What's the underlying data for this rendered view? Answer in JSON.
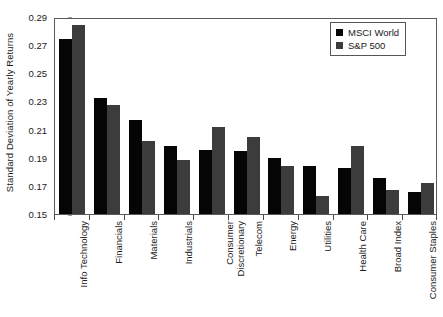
{
  "chart_data": {
    "type": "bar",
    "title": "",
    "xlabel": "",
    "ylabel": "Standard Deviation of Yearly Returns",
    "ylim": [
      0.15,
      0.29
    ],
    "yticks": [
      0.15,
      0.17,
      0.19,
      0.21,
      0.23,
      0.25,
      0.27,
      0.29
    ],
    "ytick_labels": [
      "0.15",
      "0.17",
      "0.19",
      "0.21",
      "0.23",
      "0.25",
      "0.27",
      "0.29"
    ],
    "grid": false,
    "legend_position": "top-right",
    "categories": [
      "Info Technology",
      "Financials",
      "Materials",
      "Industrials",
      "Consumer Discretionary",
      "Telecom",
      "Energy",
      "Utilities",
      "Health Care",
      "Broad Index",
      "Consumer Staples"
    ],
    "category_lines": [
      [
        "Info Technology"
      ],
      [
        "Financials"
      ],
      [
        "Materials"
      ],
      [
        "Industrials"
      ],
      [
        "Consumer",
        "Discretionary"
      ],
      [
        "Telecom"
      ],
      [
        "Energy"
      ],
      [
        "Utilities"
      ],
      [
        "Health Care"
      ],
      [
        "Broad Index"
      ],
      [
        "Consumer Staples"
      ]
    ],
    "series": [
      {
        "name": "MSCI World",
        "color": "#050505",
        "values": [
          0.2745,
          0.2325,
          0.2165,
          0.198,
          0.1955,
          0.195,
          0.19,
          0.184,
          0.183,
          0.1755,
          0.166
        ]
      },
      {
        "name": "S&P 500",
        "color": "#3c3c3c",
        "values": [
          0.284,
          0.2275,
          0.202,
          0.1885,
          0.212,
          0.2045,
          0.184,
          0.163,
          0.198,
          0.167,
          0.172
        ]
      }
    ]
  },
  "legend": {
    "items": [
      {
        "label": "MSCI World",
        "color": "#050505"
      },
      {
        "label": "S&P 500",
        "color": "#3c3c3c"
      }
    ]
  }
}
